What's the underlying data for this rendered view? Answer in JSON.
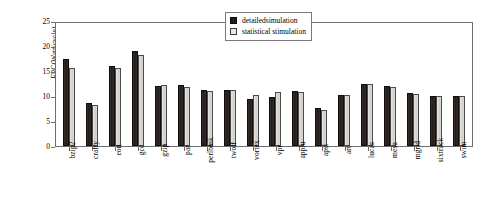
{
  "chart_data": {
    "type": "bar",
    "title": "",
    "xlabel": "",
    "ylabel": "EPC(Watt/cycle)",
    "ylim": [
      0,
      25
    ],
    "yticks": [
      0,
      5,
      10,
      15,
      20,
      25
    ],
    "grid": false,
    "legend_position": "top-right",
    "categories": [
      "bzip2",
      "crafty",
      "eon",
      "gcc",
      "gzip",
      "par",
      "perlbmk",
      "twolf",
      "vortex",
      "vpr",
      "applu",
      "apsi",
      "art",
      "lucas",
      "mesa",
      "mgrid",
      "sixtrack",
      "swim"
    ],
    "series": [
      {
        "name": "detailedsimulation",
        "color": "#221d1a",
        "values": [
          17.4,
          8.7,
          16.0,
          19.0,
          12.0,
          12.2,
          11.3,
          11.3,
          9.4,
          9.9,
          11.0,
          7.7,
          10.3,
          12.5,
          12.0,
          10.6,
          10.0,
          10.0
        ]
      },
      {
        "name": "statistical stimulation",
        "color": "#e0e0dc",
        "values": [
          15.6,
          8.3,
          15.7,
          18.3,
          12.2,
          11.9,
          11.0,
          11.2,
          10.2,
          10.8,
          10.8,
          7.2,
          10.3,
          12.4,
          11.8,
          10.5,
          10.0,
          10.0
        ]
      }
    ]
  },
  "legend": {
    "entries": [
      {
        "label": "detailedsimulation"
      },
      {
        "label": "statistical stimulation"
      }
    ]
  }
}
